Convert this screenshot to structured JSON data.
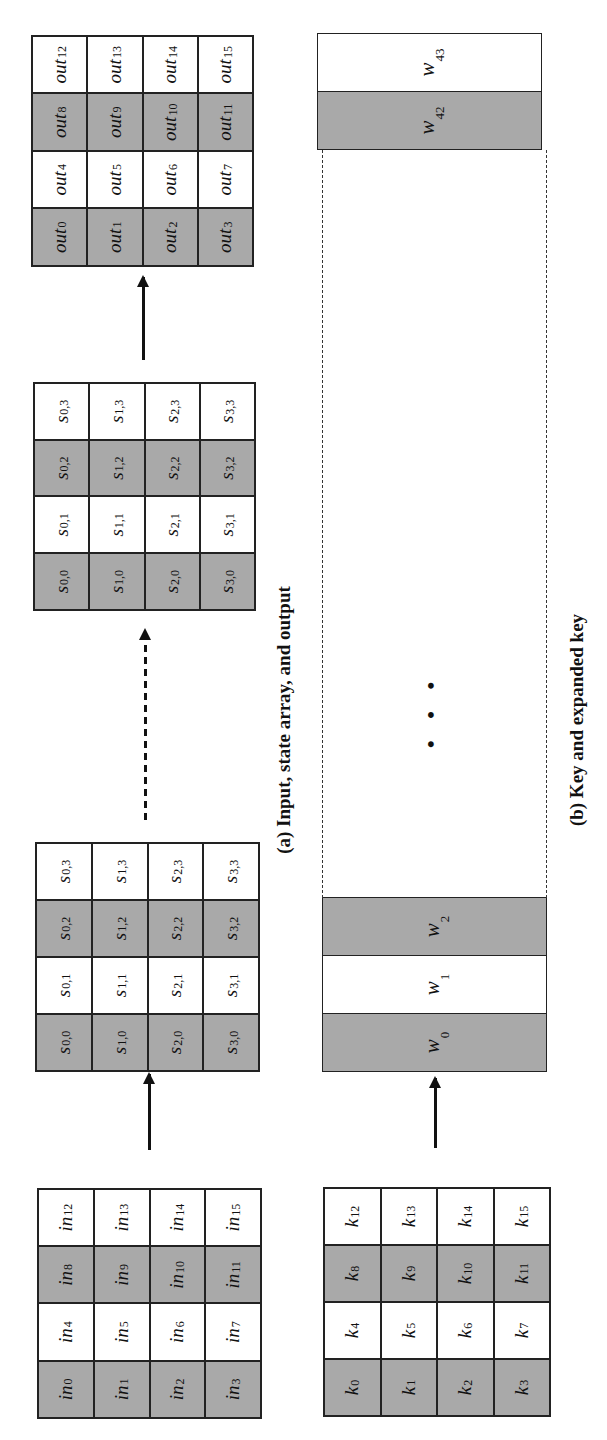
{
  "figure": {
    "caption_a": "(a) Input, state array, and output",
    "caption_b": "(b) Key and expanded key",
    "ellipsis": "• • •",
    "shading": {
      "shaded": "#a9a9a9",
      "plain": "#ffffff",
      "border": "#222222"
    }
  },
  "input": {
    "prefix": "in",
    "cells": [
      {
        "b": "in",
        "s": "0"
      },
      {
        "b": "in",
        "s": "1"
      },
      {
        "b": "in",
        "s": "2"
      },
      {
        "b": "in",
        "s": "3"
      },
      {
        "b": "in",
        "s": "4"
      },
      {
        "b": "in",
        "s": "5"
      },
      {
        "b": "in",
        "s": "6"
      },
      {
        "b": "in",
        "s": "7"
      },
      {
        "b": "in",
        "s": "8"
      },
      {
        "b": "in",
        "s": "9"
      },
      {
        "b": "in",
        "s": "10"
      },
      {
        "b": "in",
        "s": "11"
      },
      {
        "b": "in",
        "s": "12"
      },
      {
        "b": "in",
        "s": "13"
      },
      {
        "b": "in",
        "s": "14"
      },
      {
        "b": "in",
        "s": "15"
      }
    ]
  },
  "state_initial": {
    "cells": [
      {
        "b": "s",
        "s": "0,0"
      },
      {
        "b": "s",
        "s": "1,0"
      },
      {
        "b": "s",
        "s": "2,0"
      },
      {
        "b": "s",
        "s": "3,0"
      },
      {
        "b": "s",
        "s": "0,1"
      },
      {
        "b": "s",
        "s": "1,1"
      },
      {
        "b": "s",
        "s": "2,1"
      },
      {
        "b": "s",
        "s": "3,1"
      },
      {
        "b": "s",
        "s": "0,2"
      },
      {
        "b": "s",
        "s": "1,2"
      },
      {
        "b": "s",
        "s": "2,2"
      },
      {
        "b": "s",
        "s": "3,2"
      },
      {
        "b": "s",
        "s": "0,3"
      },
      {
        "b": "s",
        "s": "1,3"
      },
      {
        "b": "s",
        "s": "2,3"
      },
      {
        "b": "s",
        "s": "3,3"
      }
    ]
  },
  "state_final": {
    "cells": [
      {
        "b": "s",
        "s": "0,0"
      },
      {
        "b": "s",
        "s": "1,0"
      },
      {
        "b": "s",
        "s": "2,0"
      },
      {
        "b": "s",
        "s": "3,0"
      },
      {
        "b": "s",
        "s": "0,1"
      },
      {
        "b": "s",
        "s": "1,1"
      },
      {
        "b": "s",
        "s": "2,1"
      },
      {
        "b": "s",
        "s": "3,1"
      },
      {
        "b": "s",
        "s": "0,2"
      },
      {
        "b": "s",
        "s": "1,2"
      },
      {
        "b": "s",
        "s": "2,2"
      },
      {
        "b": "s",
        "s": "3,2"
      },
      {
        "b": "s",
        "s": "0,3"
      },
      {
        "b": "s",
        "s": "1,3"
      },
      {
        "b": "s",
        "s": "2,3"
      },
      {
        "b": "s",
        "s": "3,3"
      }
    ]
  },
  "output": {
    "cells": [
      {
        "b": "out",
        "s": "0"
      },
      {
        "b": "out",
        "s": "1"
      },
      {
        "b": "out",
        "s": "2"
      },
      {
        "b": "out",
        "s": "3"
      },
      {
        "b": "out",
        "s": "4"
      },
      {
        "b": "out",
        "s": "5"
      },
      {
        "b": "out",
        "s": "6"
      },
      {
        "b": "out",
        "s": "7"
      },
      {
        "b": "out",
        "s": "8"
      },
      {
        "b": "out",
        "s": "9"
      },
      {
        "b": "out",
        "s": "10"
      },
      {
        "b": "out",
        "s": "11"
      },
      {
        "b": "out",
        "s": "12"
      },
      {
        "b": "out",
        "s": "13"
      },
      {
        "b": "out",
        "s": "14"
      },
      {
        "b": "out",
        "s": "15"
      }
    ]
  },
  "key": {
    "cells": [
      {
        "b": "k",
        "s": "0"
      },
      {
        "b": "k",
        "s": "1"
      },
      {
        "b": "k",
        "s": "2"
      },
      {
        "b": "k",
        "s": "3"
      },
      {
        "b": "k",
        "s": "4"
      },
      {
        "b": "k",
        "s": "5"
      },
      {
        "b": "k",
        "s": "6"
      },
      {
        "b": "k",
        "s": "7"
      },
      {
        "b": "k",
        "s": "8"
      },
      {
        "b": "k",
        "s": "9"
      },
      {
        "b": "k",
        "s": "10"
      },
      {
        "b": "k",
        "s": "11"
      },
      {
        "b": "k",
        "s": "12"
      },
      {
        "b": "k",
        "s": "13"
      },
      {
        "b": "k",
        "s": "14"
      },
      {
        "b": "k",
        "s": "15"
      }
    ]
  },
  "expanded_key": {
    "words": [
      {
        "b": "w",
        "s": "0"
      },
      {
        "b": "w",
        "s": "1"
      },
      {
        "b": "w",
        "s": "2"
      },
      {
        "b": "w",
        "s": "42"
      },
      {
        "b": "w",
        "s": "43"
      }
    ]
  }
}
